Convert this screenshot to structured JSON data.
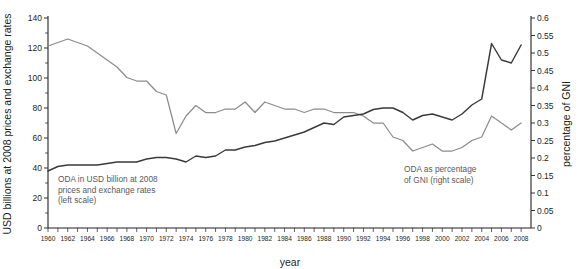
{
  "chart_data": {
    "type": "line",
    "title": "",
    "xlabel": "year",
    "ylabel": "USD billions at 2008 prices and exchange rates",
    "y2label": "percentage of GNI",
    "xlim": [
      1960,
      2009
    ],
    "ylim": [
      0,
      140
    ],
    "y2lim": [
      0,
      0.6
    ],
    "grid": false,
    "legend_position": "inline-annotations",
    "ytick_labels": [
      "0",
      "20",
      "40",
      "60",
      "80",
      "100",
      "120",
      "140"
    ],
    "ytick_values": [
      0,
      20,
      40,
      60,
      80,
      100,
      120,
      140
    ],
    "yminor_values": [
      10,
      30,
      50,
      70,
      90,
      110,
      130
    ],
    "y2tick_labels": [
      "0",
      "0.05",
      "0.1",
      "0.15",
      "0.2",
      "0.25",
      "0.3",
      "0.35",
      "0.4",
      "0.45",
      "0.5",
      "0.55",
      "0.6"
    ],
    "y2tick_values": [
      0,
      0.05,
      0.1,
      0.15,
      0.2,
      0.25,
      0.3,
      0.35,
      0.4,
      0.45,
      0.5,
      0.55,
      0.6
    ],
    "xtick_labels": [
      "1960",
      "1962",
      "1964",
      "1966",
      "1968",
      "1970",
      "1972",
      "1974",
      "1976",
      "1978",
      "1980",
      "1982",
      "1984",
      "1986",
      "1988",
      "1990",
      "1992",
      "1994",
      "1996",
      "1998",
      "2000",
      "2002",
      "2004",
      "2006",
      "2008"
    ],
    "xtick_values": [
      1960,
      1962,
      1964,
      1966,
      1968,
      1970,
      1972,
      1974,
      1976,
      1978,
      1980,
      1982,
      1984,
      1986,
      1988,
      1990,
      1992,
      1994,
      1996,
      1998,
      2000,
      2002,
      2004,
      2006,
      2008
    ],
    "x": [
      1960,
      1961,
      1962,
      1963,
      1964,
      1965,
      1966,
      1967,
      1968,
      1969,
      1970,
      1971,
      1972,
      1973,
      1974,
      1975,
      1976,
      1977,
      1978,
      1979,
      1980,
      1981,
      1982,
      1983,
      1984,
      1985,
      1986,
      1987,
      1988,
      1989,
      1990,
      1991,
      1992,
      1993,
      1994,
      1995,
      1996,
      1997,
      1998,
      1999,
      2000,
      2001,
      2002,
      2003,
      2004,
      2005,
      2006,
      2007,
      2008
    ],
    "series": [
      {
        "name": "ODA in USD billion at 2008 prices and exchange rates (left scale)",
        "axis": "left",
        "unit": "USD billion (2008 prices)",
        "color": "#3a3a3c",
        "values": [
          38,
          41,
          42,
          42,
          42,
          42,
          43,
          44,
          44,
          44,
          46,
          47,
          47,
          46,
          44,
          48,
          47,
          48,
          52,
          52,
          54,
          55,
          57,
          58,
          60,
          62,
          64,
          67,
          70,
          69,
          74,
          75,
          76,
          79,
          80,
          80,
          77,
          72,
          75,
          76,
          74,
          72,
          76,
          82,
          86,
          123,
          112,
          110,
          122
        ]
      },
      {
        "name": "ODA as percentage of GNI (right scale)",
        "axis": "right",
        "unit": "percentage of GNI",
        "color": "#8c8c8e",
        "values": [
          0.52,
          0.53,
          0.54,
          0.53,
          0.52,
          0.5,
          0.48,
          0.46,
          0.43,
          0.42,
          0.42,
          0.39,
          0.38,
          0.27,
          0.32,
          0.35,
          0.33,
          0.33,
          0.34,
          0.34,
          0.36,
          0.33,
          0.36,
          0.35,
          0.34,
          0.34,
          0.33,
          0.34,
          0.34,
          0.33,
          0.33,
          0.33,
          0.32,
          0.3,
          0.3,
          0.26,
          0.25,
          0.22,
          0.23,
          0.24,
          0.22,
          0.22,
          0.23,
          0.25,
          0.26,
          0.32,
          0.3,
          0.28,
          0.3
        ]
      }
    ],
    "annotations": [
      {
        "name": "oda-usd-annotation",
        "lines": [
          "ODA in USD billion at 2008",
          "prices and exchange rates",
          "(left scale)"
        ],
        "x_px": 58,
        "y_px": 182
      },
      {
        "name": "oda-gni-annotation",
        "lines": [
          "ODA as percentage",
          "of GNI (right scale)"
        ],
        "x_px": 404,
        "y_px": 172
      }
    ]
  },
  "colors": {
    "oda_line": "#3a3a3c",
    "gni_line": "#8c8c8e",
    "axis": "#231f20",
    "annotation_text": "#58595b",
    "background": "#ffffff"
  }
}
